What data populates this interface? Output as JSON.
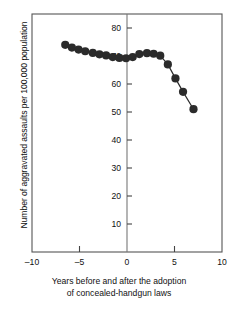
{
  "chart_data": {
    "type": "scatter",
    "title": "",
    "xlabel": "Years before and after the adoption of concealed-handgun laws",
    "ylabel": "Number of aggravated assaults per 100,000 population",
    "xlim": [
      -10,
      10
    ],
    "ylim": [
      0,
      85
    ],
    "xticks": [
      -10,
      -5,
      0,
      5,
      10
    ],
    "xtick_labels": [
      "–10",
      "–5",
      "0",
      "5",
      "10"
    ],
    "yticks": [
      10,
      20,
      30,
      40,
      50,
      60,
      70,
      80
    ],
    "ytick_labels": [
      "10",
      "20",
      "30",
      "40",
      "50",
      "60",
      "70",
      "80"
    ],
    "grid": false,
    "legend": null,
    "marker": "filled-circle",
    "marker_color": "#2b2b2b",
    "line_color": "#2b2b2b",
    "frame_color": "#555555",
    "vertical_reference_line_x": 0,
    "x": [
      -6.5,
      -5.8,
      -5.1,
      -4.4,
      -3.6,
      -2.9,
      -2.2,
      -1.5,
      -0.8,
      -0.1,
      0.6,
      1.3,
      2.1,
      2.8,
      3.5,
      4.3,
      5.1,
      5.9,
      7.0
    ],
    "values": [
      74.0,
      73.0,
      72.3,
      71.7,
      71.1,
      70.6,
      70.2,
      69.6,
      69.3,
      69.2,
      69.6,
      70.7,
      71.0,
      70.8,
      70.1,
      67.0,
      62.0,
      57.2,
      51.0
    ],
    "series": [
      {
        "name": "Aggravated assault rate",
        "values": [
          74.0,
          73.0,
          72.3,
          71.7,
          71.1,
          70.6,
          70.2,
          69.6,
          69.3,
          69.2,
          69.6,
          70.7,
          71.0,
          70.8,
          70.1,
          67.0,
          62.0,
          57.2,
          51.0
        ]
      }
    ]
  },
  "axis": {
    "ylabel_text": "Number of aggravated assaults per 100,000 population",
    "caption_line1": "Years before and after the adoption",
    "caption_line2": "of concealed-handgun laws"
  }
}
